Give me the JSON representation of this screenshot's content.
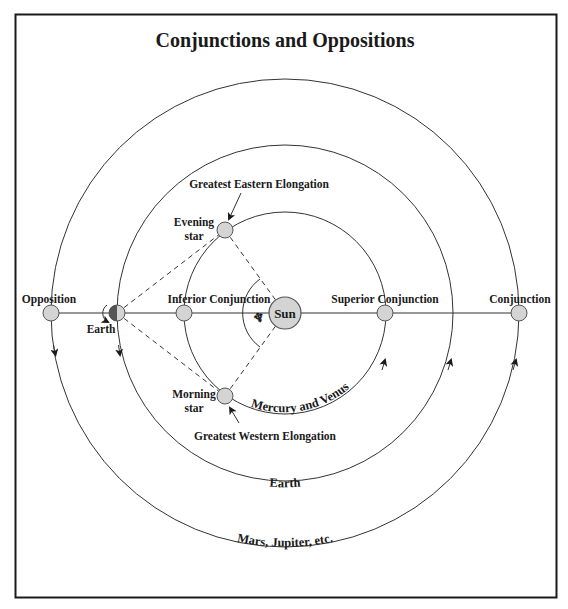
{
  "title": "Conjunctions and Oppositions",
  "colors": {
    "frame": "#1a1a1a",
    "line": "#333333",
    "planet_fill": "#d4d4d4",
    "planet_stroke": "#555555",
    "earth_dark": "#555555",
    "text": "#1a1a1a"
  },
  "bodies": {
    "sun": "Sun",
    "earth": "Earth"
  },
  "positions": {
    "opposition": "Opposition",
    "inferior_conjunction": "Inferior Conjunction",
    "superior_conjunction": "Superior Conjunction",
    "conjunction": "Conjunction",
    "evening_star_line1": "Evening",
    "evening_star_line2": "star",
    "morning_star_line1": "Morning",
    "morning_star_line2": "star",
    "greatest_eastern_elongation": "Greatest Eastern Elongation",
    "greatest_western_elongation": "Greatest Western Elongation"
  },
  "orbits": {
    "inner": "Mercury and Venus",
    "earth": "Earth",
    "outer": "Mars, Jupiter, etc."
  },
  "angle_symbol": "♆"
}
